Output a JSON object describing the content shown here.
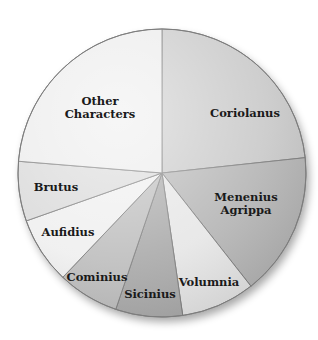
{
  "chart_data": {
    "type": "pie",
    "title": "",
    "start_angle_deg": 0,
    "direction": "clockwise",
    "center": [
      162,
      173
    ],
    "radius": 144,
    "categories": [
      "Coriolanus",
      "Menenius Agrippa",
      "Volumnia",
      "Sicinius",
      "Cominius",
      "Aufidius",
      "Brutus",
      "Other Characters"
    ],
    "values": [
      23.3,
      16.1,
      8.3,
      7.5,
      6.9,
      7.5,
      6.7,
      23.7
    ],
    "slices": [
      {
        "label": "Coriolanus",
        "lines": [
          "Coriolanus"
        ],
        "value": 23.3,
        "color": "#c9c9c9",
        "label_pos": [
          245,
          113
        ]
      },
      {
        "label": "Menenius Agrippa",
        "lines": [
          "Menenius",
          "Agrippa"
        ],
        "value": 16.1,
        "color": "#b5b5b5",
        "label_pos": [
          246,
          203
        ]
      },
      {
        "label": "Volumnia",
        "lines": [
          "Volumnia"
        ],
        "value": 8.3,
        "color": "#e6e6e6",
        "label_pos": [
          209,
          282
        ]
      },
      {
        "label": "Sicinius",
        "lines": [
          "Sicinius"
        ],
        "value": 7.5,
        "color": "#a9a9a9",
        "label_pos": [
          150,
          294
        ]
      },
      {
        "label": "Cominius",
        "lines": [
          "Cominius"
        ],
        "value": 6.9,
        "color": "#bdbdbd",
        "label_pos": [
          97,
          277
        ]
      },
      {
        "label": "Aufidius",
        "lines": [
          "Aufidius"
        ],
        "value": 7.5,
        "color": "#efefef",
        "label_pos": [
          68,
          232
        ]
      },
      {
        "label": "Brutus",
        "lines": [
          "Brutus"
        ],
        "value": 6.7,
        "color": "#dadada",
        "label_pos": [
          56,
          187
        ]
      },
      {
        "label": "Other Characters",
        "lines": [
          "Other",
          "Characters"
        ],
        "value": 23.7,
        "color": "#ececec",
        "label_pos": [
          100,
          107
        ]
      }
    ],
    "legend": "none",
    "grid": false
  }
}
